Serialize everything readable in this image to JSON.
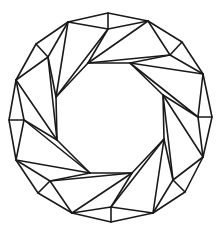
{
  "diagram": {
    "title": "Brilliant-cut gemstone (top view)",
    "stroke_color": "#1a1a1a",
    "background": "#ffffff",
    "outer_ring": [
      [
        108,
        13
      ],
      [
        148,
        21
      ],
      [
        182,
        42
      ],
      [
        203,
        74
      ],
      [
        212,
        117
      ],
      [
        203,
        157
      ],
      [
        185,
        192
      ],
      [
        153,
        213
      ],
      [
        111,
        222
      ],
      [
        72,
        213
      ],
      [
        38,
        193
      ],
      [
        16,
        160
      ],
      [
        9,
        120
      ],
      [
        16,
        80
      ],
      [
        36,
        44
      ],
      [
        68,
        22
      ]
    ],
    "star_points": [
      [
        108,
        29
      ],
      [
        170,
        55
      ],
      [
        198,
        117
      ],
      [
        173,
        180
      ],
      [
        111,
        207
      ],
      [
        50,
        181
      ],
      [
        24,
        120
      ],
      [
        48,
        57
      ]
    ],
    "table_octagon": [
      [
        88,
        63
      ],
      [
        130,
        63
      ],
      [
        163,
        95
      ],
      [
        164,
        139
      ],
      [
        132,
        173
      ],
      [
        90,
        173
      ],
      [
        57,
        140
      ],
      [
        56,
        97
      ]
    ]
  }
}
